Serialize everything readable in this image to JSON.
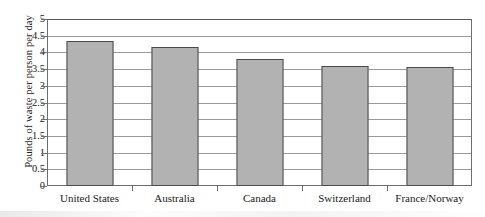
{
  "chart_data": {
    "type": "bar",
    "title": "",
    "xlabel": "",
    "ylabel": "Pounds of waste per person per day",
    "categories": [
      "United States",
      "Australia",
      "Canada",
      "Switzerland",
      "France/Norway"
    ],
    "values": [
      4.35,
      4.15,
      3.8,
      3.6,
      3.55
    ],
    "series": [
      {
        "name": "Pounds of waste per person per day",
        "values": [
          4.35,
          4.15,
          3.8,
          3.6,
          3.55
        ]
      }
    ],
    "ylim": [
      0,
      5
    ],
    "ytick_labels": [
      "0",
      "0.5",
      "1",
      "1.5",
      "2",
      "2.5",
      "3",
      "3.5",
      "4",
      "4.5",
      "5"
    ],
    "ytick_values": [
      0,
      0.5,
      1,
      1.5,
      2,
      2.5,
      3,
      3.5,
      4,
      4.5,
      5
    ],
    "grid": true,
    "legend": false,
    "legend_position": "none",
    "bar_color": "#b2b2b2",
    "bar_border_color": "#4a4a4a",
    "gridline_color": "#9a9a9a",
    "axis_color": "#6d6d6d",
    "background_color": "#ffffff"
  }
}
